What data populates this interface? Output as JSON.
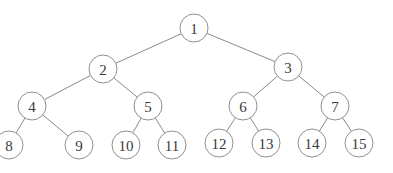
{
  "diagram": {
    "type": "binary-tree",
    "node_radius": 14,
    "nodes": [
      {
        "id": "1",
        "label": "1",
        "x": 194,
        "y": 28
      },
      {
        "id": "2",
        "label": "2",
        "x": 103,
        "y": 69
      },
      {
        "id": "3",
        "label": "3",
        "x": 288,
        "y": 67
      },
      {
        "id": "4",
        "label": "4",
        "x": 32,
        "y": 106
      },
      {
        "id": "5",
        "label": "5",
        "x": 148,
        "y": 106
      },
      {
        "id": "6",
        "label": "6",
        "x": 243,
        "y": 106
      },
      {
        "id": "7",
        "label": "7",
        "x": 335,
        "y": 106
      },
      {
        "id": "8",
        "label": "8",
        "x": 9,
        "y": 145
      },
      {
        "id": "9",
        "label": "9",
        "x": 79,
        "y": 145
      },
      {
        "id": "10",
        "label": "10",
        "x": 126,
        "y": 145
      },
      {
        "id": "11",
        "label": "11",
        "x": 172,
        "y": 145
      },
      {
        "id": "12",
        "label": "12",
        "x": 219,
        "y": 143
      },
      {
        "id": "13",
        "label": "13",
        "x": 266,
        "y": 143
      },
      {
        "id": "14",
        "label": "14",
        "x": 312,
        "y": 143
      },
      {
        "id": "15",
        "label": "15",
        "x": 359,
        "y": 143
      }
    ],
    "edges": [
      [
        "1",
        "2"
      ],
      [
        "1",
        "3"
      ],
      [
        "2",
        "4"
      ],
      [
        "2",
        "5"
      ],
      [
        "3",
        "6"
      ],
      [
        "3",
        "7"
      ],
      [
        "4",
        "8"
      ],
      [
        "4",
        "9"
      ],
      [
        "5",
        "10"
      ],
      [
        "5",
        "11"
      ],
      [
        "6",
        "12"
      ],
      [
        "6",
        "13"
      ],
      [
        "7",
        "14"
      ],
      [
        "7",
        "15"
      ]
    ]
  }
}
